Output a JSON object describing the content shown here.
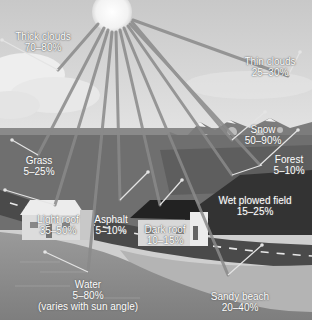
{
  "diagram": {
    "labels": [
      {
        "id": "thick-clouds",
        "name": "Thick clouds",
        "value": "70–80%"
      },
      {
        "id": "thin-clouds",
        "name": "Thin clouds",
        "value": "25–30%"
      },
      {
        "id": "snow",
        "name": "Snow",
        "value": "50–90%"
      },
      {
        "id": "forest",
        "name": "Forest",
        "value": "5–10%"
      },
      {
        "id": "grass",
        "name": "Grass",
        "value": "5–25%"
      },
      {
        "id": "wet-plowed-field",
        "name": "Wet plowed field",
        "value": "15–25%"
      },
      {
        "id": "light-roof",
        "name": "Light roof",
        "value": "35–50%"
      },
      {
        "id": "asphalt",
        "name": "Asphalt",
        "value": "5–10%"
      },
      {
        "id": "dark-roof",
        "name": "Dark roof",
        "value": "10–15%"
      },
      {
        "id": "water",
        "name": "Water",
        "value": "5–80%",
        "note": "(varies with sun angle)"
      },
      {
        "id": "sandy-beach",
        "name": "Sandy beach",
        "value": "20–40%"
      }
    ],
    "colors": {
      "sky": "#d4d4d4",
      "sun": "#f4f4f4",
      "ray": "#8a8a8a",
      "reflect": "#e6e6e6",
      "mountain": "#7a7a7a",
      "field": "#6e6e6e",
      "dark_field": "#3e3e3e",
      "road": "#4a4a4a",
      "water": "#8c8c8c",
      "beach": "#b8b8b8"
    }
  }
}
